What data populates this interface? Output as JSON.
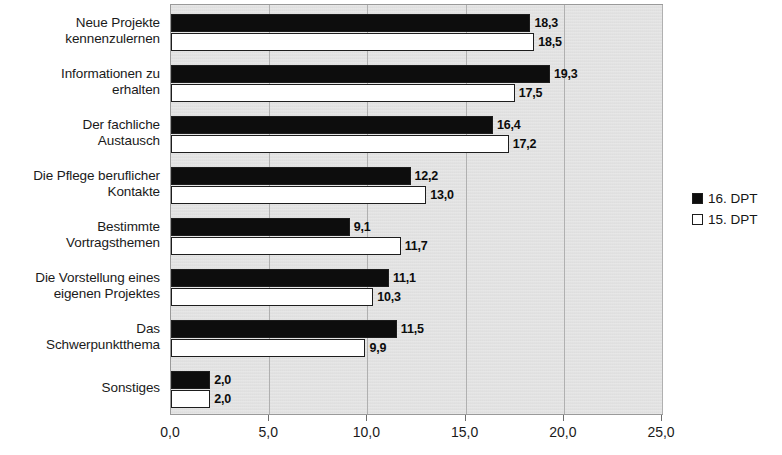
{
  "chart_data": {
    "type": "bar",
    "orientation": "horizontal",
    "title": "",
    "subtitle": "",
    "xlabel": "",
    "ylabel": "",
    "xlim": [
      0.0,
      25.0
    ],
    "xticks": [
      "0,0",
      "5,0",
      "10,0",
      "15,0",
      "20,0",
      "25,0"
    ],
    "xtick_values": [
      0.0,
      5.0,
      10.0,
      15.0,
      20.0,
      25.0
    ],
    "grid": true,
    "grid_axis": "x",
    "legend_position": "right",
    "categories": [
      "Neue Projekte kennenzulernen",
      "Informationen zu erhalten",
      "Der fachliche Austausch",
      "Die Pflege beruflicher Kontakte",
      "Bestimmte Vortragsthemen",
      "Die Vorstellung eines eigenen Projektes",
      "Das Schwerpunktthema",
      "Sonstiges"
    ],
    "category_lines": [
      [
        "Neue Projekte",
        "kennenzulernen"
      ],
      [
        "Informationen zu",
        "erhalten"
      ],
      [
        "Der fachliche",
        "Austausch"
      ],
      [
        "Die Pflege beruflicher",
        "Kontakte"
      ],
      [
        "Bestimmte",
        "Vortragsthemen"
      ],
      [
        "Die Vorstellung eines",
        "eigenen Projektes"
      ],
      [
        "Das",
        "Schwerpunktthema"
      ],
      [
        "Sonstiges"
      ]
    ],
    "series": [
      {
        "name": "16. DPT",
        "color": "#0d0d0d",
        "values": [
          18.3,
          19.3,
          16.4,
          12.2,
          9.1,
          11.1,
          11.5,
          2.0
        ],
        "labels": [
          "18,3",
          "19,3",
          "16,4",
          "12,2",
          "9,1",
          "11,1",
          "11,5",
          "2,0"
        ]
      },
      {
        "name": "15. DPT",
        "color": "#ffffff",
        "values": [
          18.5,
          17.5,
          17.2,
          13.0,
          11.7,
          10.3,
          9.9,
          2.0
        ],
        "labels": [
          "18,5",
          "17,5",
          "17,2",
          "13,0",
          "11,7",
          "10,3",
          "9,9",
          "2,0"
        ]
      }
    ]
  },
  "legend": {
    "items": [
      {
        "label": "16. DPT",
        "swatch": "s0"
      },
      {
        "label": "15. DPT",
        "swatch": "s1"
      }
    ]
  }
}
